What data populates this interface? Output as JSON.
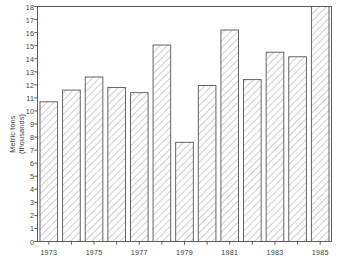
{
  "chart_data": {
    "type": "bar",
    "title": "",
    "subtitle": "",
    "xlabel": "",
    "ylabel": "Metric tons (thousands)",
    "ylabel_lines": [
      "Metric tons",
      "(thousands)"
    ],
    "categories": [
      "1973",
      "1974",
      "1975",
      "1976",
      "1977",
      "1978",
      "1979",
      "1980",
      "1981",
      "1982",
      "1983",
      "1984",
      "1985"
    ],
    "values": [
      10.7,
      11.6,
      12.6,
      11.8,
      11.4,
      15.05,
      7.6,
      11.95,
      16.2,
      12.4,
      14.5,
      14.15,
      18.0
    ],
    "ylim": [
      0,
      18
    ],
    "ytick_step": 1,
    "yticks": [
      "0",
      "1",
      "2",
      "3",
      "4",
      "5",
      "6",
      "7",
      "8",
      "9",
      "10",
      "11",
      "12",
      "13",
      "14",
      "15",
      "16",
      "17",
      "18"
    ],
    "xticks_labeled": [
      "1973",
      "1975",
      "1977",
      "1979",
      "1981",
      "1983",
      "1985"
    ],
    "grid": false,
    "legend": null,
    "legend_position": "none",
    "bar_style": {
      "fill": "hatched-diagonal",
      "edge_color": "#555555",
      "hatch_color": "#8a8a8a",
      "face_color": "#ffffff"
    },
    "axis_color": "#4a4a4a",
    "background": "#ffffff"
  }
}
